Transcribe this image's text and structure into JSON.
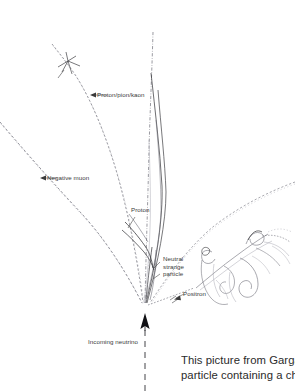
{
  "figure": {
    "kind": "bubble-chamber-event-tracing",
    "background_color": "#ffffff",
    "track_color": "#6e6e78",
    "solid_track_color": "#2f2f33",
    "faint_track_color": "#a9a9b2",
    "label_color": "#3a3a3a",
    "caption_color": "#2b2b2b"
  },
  "labels": {
    "proton_pion_kaon": "Proton/pion/kaon",
    "negative_muon": "Negative muon",
    "proton": "Proton",
    "neutral_strange_line1": "Neutral",
    "neutral_strange_line2": "strange",
    "neutral_strange_line3": "particle",
    "positron": "Positron",
    "incoming_neutrino": "Incoming neutrino"
  },
  "caption": {
    "line1": "This picture from Gargan",
    "line2": "particle containing a cha"
  }
}
